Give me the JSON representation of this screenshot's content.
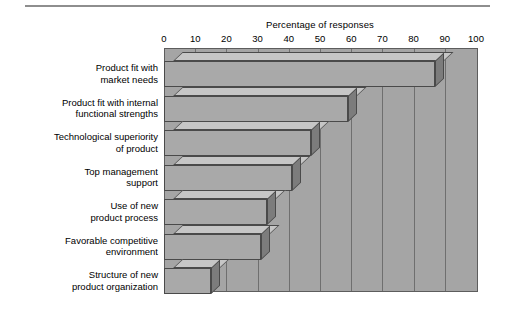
{
  "chart_data": {
    "type": "bar",
    "orientation": "horizontal",
    "title": "Percentage of responses",
    "xlabel": "",
    "ylabel": "",
    "xlim": [
      0,
      100
    ],
    "xticks": [
      0,
      10,
      20,
      30,
      40,
      50,
      60,
      70,
      80,
      90,
      100
    ],
    "grid": true,
    "legend": null,
    "style": "3d-horizontal-bar",
    "categories": [
      "Product fit with\nmarket needs",
      "Product fit with internal\nfunctional strengths",
      "Technological superiority\nof product",
      "Top management\nsupport",
      "Use of new\nproduct process",
      "Favorable competitive\nenvironment",
      "Structure of new\nproduct organization"
    ],
    "values": [
      87,
      59,
      47,
      41,
      33,
      31,
      15
    ],
    "colors": {
      "bar_front": "#a9a9a9",
      "bar_top": "#c6c6c6",
      "bar_side": "#7c7c7c",
      "plot_background": "#a5a5a5",
      "gridline": "#6f6f6f",
      "outline": "#4a4a4a",
      "page_background": "#ffffff",
      "rule": "#8e8e8e"
    }
  }
}
